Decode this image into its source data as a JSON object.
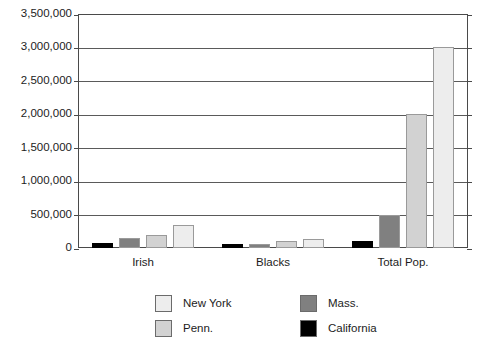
{
  "chart_data": {
    "type": "bar",
    "title": "",
    "xlabel": "",
    "ylabel": "",
    "categories": [
      "Irish",
      "Blacks",
      "Total Pop."
    ],
    "ylim": [
      0,
      3500000
    ],
    "yticks": [
      0,
      500000,
      1000000,
      1500000,
      2000000,
      2500000,
      3000000,
      3500000
    ],
    "ytick_labels": [
      "0",
      "500,000",
      "1,000,000",
      "1,500,000",
      "2,000,000",
      "2,500,000",
      "3,000,000",
      "3,500,000"
    ],
    "grid": true,
    "legend_position": "bottom",
    "bar_order_in_group": [
      "California",
      "Mass.",
      "Penn.",
      "New York"
    ],
    "series": [
      {
        "name": "California",
        "color": "#000000",
        "values": [
          80000,
          60000,
          100000
        ]
      },
      {
        "name": "Mass.",
        "color": "#808080",
        "values": [
          150000,
          60000,
          500000
        ]
      },
      {
        "name": "Penn.",
        "color": "#d2d2d2",
        "values": [
          200000,
          110000,
          2000000
        ]
      },
      {
        "name": "New York",
        "color": "#ededed",
        "values": [
          340000,
          140000,
          3000000
        ]
      }
    ]
  },
  "legend": {
    "entries": [
      {
        "label": "New York",
        "color": "#ededed"
      },
      {
        "label": "Penn.",
        "color": "#d2d2d2"
      },
      {
        "label": "Mass.",
        "color": "#808080"
      },
      {
        "label": "California",
        "color": "#000000"
      }
    ]
  },
  "axis": {
    "line_color": "#4a4a4a",
    "grid_color": "#5a5a5a"
  }
}
